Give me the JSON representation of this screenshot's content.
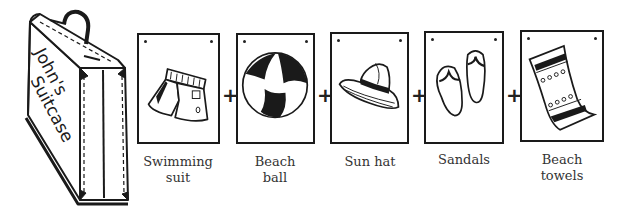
{
  "suitcase": {
    "line1": "John's",
    "line2": "Suitcase"
  },
  "operator": "+",
  "items": [
    {
      "name": "swimming-suit",
      "label": "Swimming\nsuit"
    },
    {
      "name": "beach-ball",
      "label": "Beach\nball"
    },
    {
      "name": "sun-hat",
      "label": "Sun hat"
    },
    {
      "name": "sandals",
      "label": "Sandals"
    },
    {
      "name": "beach-towels",
      "label": "Beach\ntowels"
    }
  ]
}
